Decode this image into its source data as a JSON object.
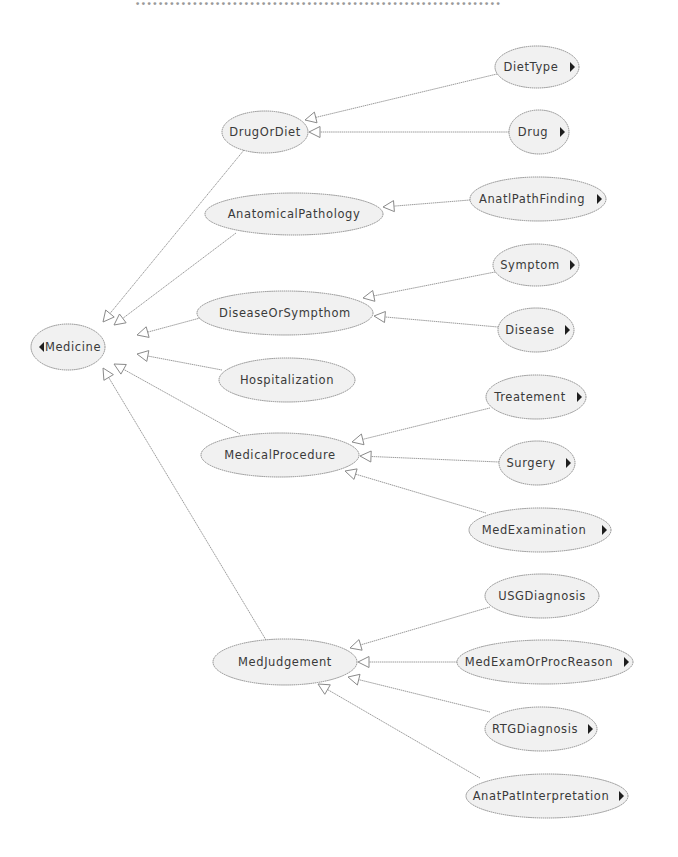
{
  "header": {
    "cut_text": "................................................................"
  },
  "diagram": {
    "root": {
      "id": "medicine",
      "label": "Medicine",
      "cx": 68,
      "cy": 347,
      "rx": 37,
      "ry": 23,
      "collapse_arrow": "left"
    },
    "nodes": [
      {
        "id": "drugordiet",
        "label": "DrugOrDiet",
        "cx": 265,
        "cy": 132,
        "rx": 43,
        "ry": 21,
        "expand": false
      },
      {
        "id": "anatomicalpathology",
        "label": "AnatomicalPathology",
        "cx": 294,
        "cy": 214,
        "rx": 89,
        "ry": 21,
        "expand": false
      },
      {
        "id": "diseaseorsympthom",
        "label": "DiseaseOrSympthom",
        "cx": 285,
        "cy": 313,
        "rx": 88,
        "ry": 22,
        "expand": false
      },
      {
        "id": "hospitalization",
        "label": "Hospitalization",
        "cx": 287,
        "cy": 380,
        "rx": 68,
        "ry": 22,
        "expand": false
      },
      {
        "id": "medicalprocedure",
        "label": "MedicalProcedure",
        "cx": 280,
        "cy": 455,
        "rx": 79,
        "ry": 22,
        "expand": false
      },
      {
        "id": "medjudgement",
        "label": "MedJudgement",
        "cx": 285,
        "cy": 662,
        "rx": 72,
        "ry": 23,
        "expand": false
      },
      {
        "id": "diettype",
        "label": "DietType",
        "cx": 537,
        "cy": 67,
        "rx": 42,
        "ry": 21,
        "expand": true
      },
      {
        "id": "drug",
        "label": "Drug",
        "cx": 539,
        "cy": 132,
        "rx": 30,
        "ry": 22,
        "expand": true
      },
      {
        "id": "anatlpathfinding",
        "label": "AnatlPathFinding",
        "cx": 538,
        "cy": 199,
        "rx": 68,
        "ry": 22,
        "expand": true
      },
      {
        "id": "symptom",
        "label": "Symptom",
        "cx": 536,
        "cy": 265,
        "rx": 43,
        "ry": 21,
        "expand": true
      },
      {
        "id": "disease",
        "label": "Disease",
        "cx": 536,
        "cy": 330,
        "rx": 38,
        "ry": 22,
        "expand": true
      },
      {
        "id": "treatement",
        "label": "Treatement",
        "cx": 536,
        "cy": 397,
        "rx": 50,
        "ry": 22,
        "expand": true
      },
      {
        "id": "surgery",
        "label": "Surgery",
        "cx": 537,
        "cy": 463,
        "rx": 38,
        "ry": 22,
        "expand": true
      },
      {
        "id": "medexamination",
        "label": "MedExamination",
        "cx": 540,
        "cy": 530,
        "rx": 71,
        "ry": 22,
        "expand": true
      },
      {
        "id": "usgdiagnosis",
        "label": "USGDiagnosis",
        "cx": 542,
        "cy": 596,
        "rx": 57,
        "ry": 22,
        "expand": false
      },
      {
        "id": "medexamorprocreason",
        "label": "MedExamOrProcReason",
        "cx": 545,
        "cy": 662,
        "rx": 88,
        "ry": 22,
        "expand": true
      },
      {
        "id": "rtgdiagnosis",
        "label": "RTGDiagnosis",
        "cx": 541,
        "cy": 729,
        "rx": 56,
        "ry": 22,
        "expand": true
      },
      {
        "id": "anatpatinterpretation",
        "label": "AnatPatInterpretation",
        "cx": 547,
        "cy": 796,
        "rx": 81,
        "ry": 22,
        "expand": true
      }
    ],
    "edges": [
      {
        "from": "drugordiet",
        "to": "medicine",
        "x1": 244,
        "y1": 150,
        "x2": 103,
        "y2": 322,
        "ax": 103,
        "ay": 322
      },
      {
        "from": "anatomicalpathology",
        "to": "medicine",
        "x1": 236,
        "y1": 233,
        "x2": 114,
        "y2": 325
      },
      {
        "from": "diseaseorsympthom",
        "to": "medicine",
        "x1": 200,
        "y1": 318,
        "x2": 137,
        "y2": 335
      },
      {
        "from": "hospitalization",
        "to": "medicine",
        "x1": 222,
        "y1": 370,
        "x2": 137,
        "y2": 354
      },
      {
        "from": "medicalprocedure",
        "to": "medicine",
        "x1": 240,
        "y1": 434,
        "x2": 114,
        "y2": 364
      },
      {
        "from": "medjudgement",
        "to": "medicine",
        "x1": 266,
        "y1": 640,
        "x2": 103,
        "y2": 368
      },
      {
        "from": "diettype",
        "to": "drugordiet",
        "x1": 497,
        "y1": 74,
        "x2": 305,
        "y2": 120
      },
      {
        "from": "drug",
        "to": "drugordiet",
        "x1": 509,
        "y1": 132,
        "x2": 309,
        "y2": 132
      },
      {
        "from": "anatlpathfinding",
        "to": "anatomicalpathology",
        "x1": 470,
        "y1": 200,
        "x2": 383,
        "y2": 207
      },
      {
        "from": "symptom",
        "to": "diseaseorsympthom",
        "x1": 495,
        "y1": 272,
        "x2": 363,
        "y2": 298
      },
      {
        "from": "disease",
        "to": "diseaseorsympthom",
        "x1": 498,
        "y1": 327,
        "x2": 374,
        "y2": 316
      },
      {
        "from": "treatement",
        "to": "medicalprocedure",
        "x1": 490,
        "y1": 408,
        "x2": 352,
        "y2": 442
      },
      {
        "from": "surgery",
        "to": "medicalprocedure",
        "x1": 499,
        "y1": 462,
        "x2": 360,
        "y2": 456
      },
      {
        "from": "medexamination",
        "to": "medicalprocedure",
        "x1": 486,
        "y1": 513,
        "x2": 345,
        "y2": 471
      },
      {
        "from": "usgdiagnosis",
        "to": "medjudgement",
        "x1": 490,
        "y1": 607,
        "x2": 350,
        "y2": 648
      },
      {
        "from": "medexamorprocreason",
        "to": "medjudgement",
        "x1": 457,
        "y1": 662,
        "x2": 358,
        "y2": 662
      },
      {
        "from": "rtgdiagnosis",
        "to": "medjudgement",
        "x1": 490,
        "y1": 712,
        "x2": 348,
        "y2": 677
      },
      {
        "from": "anatpatinterpretation",
        "to": "medjudgement",
        "x1": 480,
        "y1": 778,
        "x2": 318,
        "y2": 684
      }
    ]
  }
}
